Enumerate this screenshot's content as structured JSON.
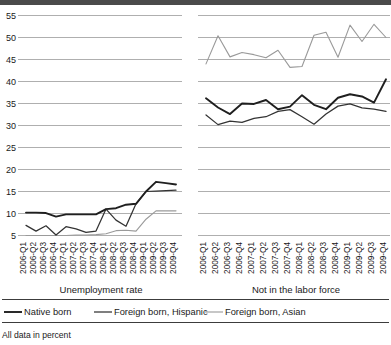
{
  "footer": {
    "note": "All data in percent"
  },
  "legend": {
    "items": [
      {
        "label": "Native born",
        "color": "#1f1f1f",
        "width": 1.9
      },
      {
        "label": "Foreign born, Hispanic",
        "color": "#333333",
        "width": 1.25
      },
      {
        "label": "Foreign born, Asian",
        "color": "#9a9a9a",
        "width": 1.1
      }
    ]
  },
  "axis": {
    "y_ticks": [
      5,
      10,
      15,
      20,
      25,
      30,
      35,
      40,
      45,
      50,
      55
    ],
    "y_min": 5,
    "y_max": 55,
    "x_categories": [
      "2006-Q1",
      "2006-Q2",
      "2006-Q3",
      "2006-Q4",
      "2007-Q1",
      "2007-Q2",
      "2007-Q3",
      "2007-Q4",
      "2008-Q1",
      "2008-Q2",
      "2008-Q3",
      "2008-Q4",
      "2009-Q1",
      "2009-Q2",
      "2009-Q3",
      "2009-Q4"
    ]
  },
  "panels": [
    {
      "title": "Unemployment rate"
    },
    {
      "title": "Not in the labor force"
    }
  ],
  "chart_data": {
    "type": "line",
    "title": "",
    "subtitle": "",
    "xlabel": "",
    "ylabel": "",
    "ylim": [
      5,
      55
    ],
    "ytick_step": 5,
    "grid": true,
    "legend_position": "bottom",
    "annotations": [
      "All data in percent"
    ],
    "panels": [
      {
        "name": "Unemployment rate",
        "x": [
          "2006-Q1",
          "2006-Q2",
          "2006-Q3",
          "2006-Q4",
          "2007-Q1",
          "2007-Q2",
          "2007-Q3",
          "2007-Q4",
          "2008-Q1",
          "2008-Q2",
          "2008-Q3",
          "2008-Q4",
          "2009-Q1",
          "2009-Q2",
          "2009-Q3",
          "2009-Q4"
        ],
        "series": [
          {
            "name": "Native born",
            "values": [
              10.2,
              10.2,
              10.1,
              9.3,
              9.8,
              9.8,
              9.8,
              9.8,
              11.0,
              11.2,
              12.0,
              12.2,
              15.0,
              17.2,
              16.9,
              16.6
            ]
          },
          {
            "name": "Foreign born, Hispanic",
            "values": [
              7.3,
              6.0,
              7.2,
              5.1,
              7.0,
              6.5,
              5.7,
              6.0,
              11.0,
              8.5,
              7.1,
              12.2,
              15.0,
              15.1,
              15.2,
              15.3
            ]
          },
          {
            "name": "Foreign born, Asian",
            "values": [
              5.0,
              5.0,
              5.0,
              5.0,
              5.0,
              5.1,
              5.1,
              5.2,
              5.4,
              6.1,
              6.2,
              6.0,
              8.7,
              10.6,
              10.6,
              10.6
            ]
          }
        ]
      },
      {
        "name": "Not in the labor force",
        "x": [
          "2006-Q1",
          "2006-Q2",
          "2006-Q3",
          "2006-Q4",
          "2007-Q1",
          "2007-Q2",
          "2007-Q3",
          "2007-Q4",
          "2008-Q1",
          "2008-Q2",
          "2008-Q3",
          "2008-Q4",
          "2009-Q1",
          "2009-Q2",
          "2009-Q3",
          "2009-Q4"
        ],
        "series": [
          {
            "name": "Native born",
            "values": [
              36.2,
              34.1,
              32.6,
              35.0,
              34.9,
              35.8,
              33.7,
              34.3,
              36.9,
              34.7,
              33.7,
              36.3,
              37.1,
              36.6,
              35.2,
              40.5
            ]
          },
          {
            "name": "Foreign born, Hispanic",
            "values": [
              32.4,
              30.2,
              31.0,
              30.7,
              31.6,
              32.0,
              33.2,
              33.6,
              32.0,
              30.3,
              32.6,
              34.4,
              34.9,
              34.0,
              33.7,
              33.2
            ]
          },
          {
            "name": "Foreign born, Asian",
            "values": [
              44.0,
              50.4,
              45.6,
              46.6,
              46.1,
              45.4,
              47.1,
              43.2,
              43.4,
              50.5,
              51.2,
              45.5,
              52.8,
              49.1,
              53.0,
              50.0
            ]
          }
        ]
      }
    ]
  }
}
